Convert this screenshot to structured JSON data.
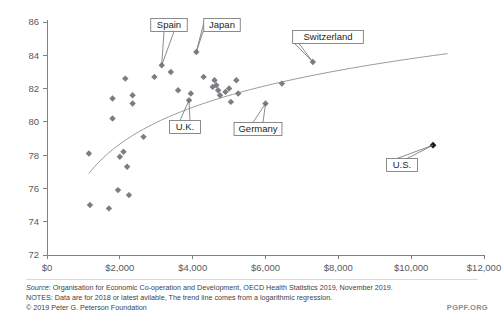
{
  "footer": {
    "source_prefix": "Source",
    "source_text": ": Organisation for Economic Co-operation and Development, OECD Health Statistics 2019, November 2019.",
    "notes": "NOTES: Data are for 2018 or latest avilable, The trend line comes from a logarithmic regression.",
    "copyright": "© 2019 Peter G. Peterson Foundation",
    "watermark": "PGPF.ORG"
  },
  "chart_data": {
    "type": "scatter",
    "title": "",
    "xlabel": "",
    "ylabel": "",
    "xlim": [
      0,
      12000
    ],
    "ylim": [
      72,
      86
    ],
    "grid": false,
    "legend": "none",
    "xticks": [
      "$0",
      "$2,000",
      "$4,000",
      "$6,000",
      "$8,000",
      "$10,000",
      "$12,000"
    ],
    "xtick_values": [
      0,
      2000,
      4000,
      6000,
      8000,
      10000,
      12000
    ],
    "yticks": [
      "72",
      "74",
      "76",
      "78",
      "80",
      "82",
      "84",
      "86"
    ],
    "ytick_values": [
      72,
      74,
      76,
      78,
      80,
      82,
      84,
      86
    ],
    "point_color": "#7b7d80",
    "highlight_color": "#1a1a1a",
    "trend_color": "#8d8f92",
    "points": [
      {
        "x": 1150,
        "y": 78.1,
        "label": ""
      },
      {
        "x": 1180,
        "y": 75.0,
        "label": ""
      },
      {
        "x": 1700,
        "y": 74.8,
        "label": ""
      },
      {
        "x": 1950,
        "y": 75.9,
        "label": ""
      },
      {
        "x": 2250,
        "y": 75.6,
        "label": ""
      },
      {
        "x": 2000,
        "y": 77.9,
        "label": ""
      },
      {
        "x": 2100,
        "y": 78.2,
        "label": ""
      },
      {
        "x": 2200,
        "y": 77.3,
        "label": ""
      },
      {
        "x": 1800,
        "y": 80.2,
        "label": ""
      },
      {
        "x": 1800,
        "y": 81.4,
        "label": ""
      },
      {
        "x": 2350,
        "y": 81.6,
        "label": ""
      },
      {
        "x": 2350,
        "y": 81.1,
        "label": ""
      },
      {
        "x": 2150,
        "y": 82.6,
        "label": ""
      },
      {
        "x": 2650,
        "y": 79.1,
        "label": ""
      },
      {
        "x": 2950,
        "y": 82.7,
        "label": ""
      },
      {
        "x": 3150,
        "y": 83.4,
        "label": "Spain"
      },
      {
        "x": 3400,
        "y": 83.0,
        "label": ""
      },
      {
        "x": 3600,
        "y": 81.9,
        "label": ""
      },
      {
        "x": 3900,
        "y": 81.3,
        "label": "U.K."
      },
      {
        "x": 3950,
        "y": 81.7,
        "label": ""
      },
      {
        "x": 4300,
        "y": 82.7,
        "label": ""
      },
      {
        "x": 4550,
        "y": 82.1,
        "label": ""
      },
      {
        "x": 4600,
        "y": 82.5,
        "label": ""
      },
      {
        "x": 4650,
        "y": 82.2,
        "label": ""
      },
      {
        "x": 4700,
        "y": 81.9,
        "label": ""
      },
      {
        "x": 4750,
        "y": 81.6,
        "label": ""
      },
      {
        "x": 4900,
        "y": 81.8,
        "label": ""
      },
      {
        "x": 5000,
        "y": 82.0,
        "label": ""
      },
      {
        "x": 5050,
        "y": 81.2,
        "label": ""
      },
      {
        "x": 5200,
        "y": 82.5,
        "label": ""
      },
      {
        "x": 5250,
        "y": 81.7,
        "label": ""
      },
      {
        "x": 4100,
        "y": 84.2,
        "label": "Japan"
      },
      {
        "x": 6000,
        "y": 81.1,
        "label": "Germany"
      },
      {
        "x": 6450,
        "y": 82.3,
        "label": ""
      },
      {
        "x": 7300,
        "y": 83.6,
        "label": "Switzerland"
      },
      {
        "x": 10600,
        "y": 78.6,
        "label": "U.S."
      }
    ],
    "callouts": [
      {
        "label": "Spain",
        "point_x": 3150,
        "point_y": 83.4
      },
      {
        "label": "Japan",
        "point_x": 4100,
        "point_y": 84.2
      },
      {
        "label": "U.K.",
        "point_x": 3900,
        "point_y": 81.3
      },
      {
        "label": "Germany",
        "point_x": 6000,
        "point_y": 81.1
      },
      {
        "label": "Switzerland",
        "point_x": 7300,
        "point_y": 83.6
      },
      {
        "label": "U.S.",
        "point_x": 10600,
        "point_y": 78.6
      }
    ],
    "trend_line": {
      "kind": "logarithmic",
      "x_start": 1150,
      "x_end": 11000,
      "y_start": 76.9,
      "y_end": 84.1
    }
  }
}
